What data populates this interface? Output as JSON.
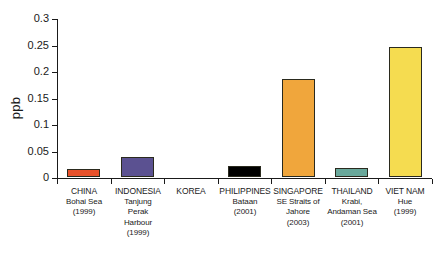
{
  "chart_data": {
    "type": "bar",
    "title": "",
    "xlabel": "",
    "ylabel": "ppb",
    "ylim": [
      0,
      0.3
    ],
    "yticks": [
      "0",
      "0.05",
      "0.1",
      "0.15",
      "0.2",
      "0.25",
      "0.3"
    ],
    "ytick_values": [
      0,
      0.05,
      0.1,
      0.15,
      0.2,
      0.25,
      0.3
    ],
    "grid": false,
    "legend": "none",
    "categories": [
      "CHINA Bohai Sea (1999)",
      "INDONESIA Tanjung Perak Harbour (1999)",
      "KOREA",
      "PHILIPPINES Bataan (2001)",
      "SINGAPORE SE Straits of Jahore (2003)",
      "THAILAND Krabi, Andaman Sea (2001)",
      "VIET NAM Hue (1999)"
    ],
    "values": [
      0.015,
      0.037,
      0,
      0.02,
      0.185,
      0.017,
      0.245
    ],
    "colors": [
      "#e8512a",
      "#5b5191",
      "#ffffff",
      "#000000",
      "#f0a63c",
      "#69a89b",
      "#f5dc50"
    ],
    "bars": [
      {
        "country": "CHINA",
        "lines": [
          "Bohai Sea",
          "(1999)"
        ],
        "value": 0.015,
        "color": "#e8512a"
      },
      {
        "country": "INDONESIA",
        "lines": [
          "Tanjung",
          "Perak",
          "Harbour",
          "(1999)"
        ],
        "value": 0.037,
        "color": "#5b5191"
      },
      {
        "country": "KOREA",
        "lines": [],
        "value": 0,
        "color": "#ffffff"
      },
      {
        "country": "PHILIPPINES",
        "lines": [
          "Bataan",
          "(2001)"
        ],
        "value": 0.02,
        "color": "#000000"
      },
      {
        "country": "SINGAPORE",
        "lines": [
          "SE Straits of",
          "Jahore",
          "(2003)"
        ],
        "value": 0.185,
        "color": "#f0a63c"
      },
      {
        "country": "THAILAND",
        "lines": [
          "Krabi,",
          "Andaman Sea",
          "(2001)"
        ],
        "value": 0.017,
        "color": "#69a89b"
      },
      {
        "country": "VIET NAM",
        "lines": [
          "Hue",
          "(1999)"
        ],
        "value": 0.245,
        "color": "#f5dc50"
      }
    ]
  },
  "axis": {
    "y_title": "ppb"
  }
}
